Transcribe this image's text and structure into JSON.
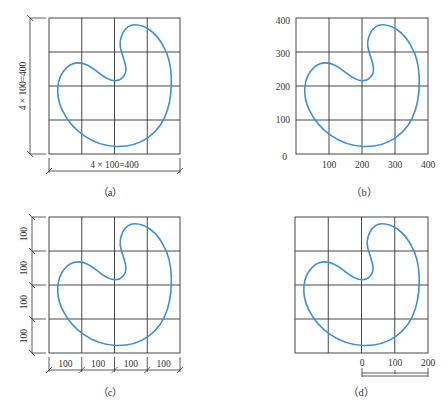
{
  "figure": {
    "shape_color": "#3d8fd4",
    "grid_color": "#333333",
    "grid": {
      "rows": 4,
      "cols": 4,
      "cell_size": 100
    },
    "panels": [
      {
        "id": "a",
        "caption": "（a）",
        "vertical_dimension": "4 × 100=400",
        "horizontal_dimension": "4 × 100=400"
      },
      {
        "id": "b",
        "caption": "（b）",
        "y_axis_labels": [
          "400",
          "300",
          "200",
          "100"
        ],
        "origin_label": "0",
        "x_axis_labels": [
          "100",
          "200",
          "300",
          "400"
        ]
      },
      {
        "id": "c",
        "caption": "（c）",
        "vertical_segments": [
          "100",
          "100",
          "100",
          "100"
        ],
        "horizontal_segments": [
          "100",
          "100",
          "100",
          "100"
        ]
      },
      {
        "id": "d",
        "caption": "（d）",
        "scale_bar_labels": [
          "0",
          "100",
          "200"
        ]
      }
    ]
  }
}
